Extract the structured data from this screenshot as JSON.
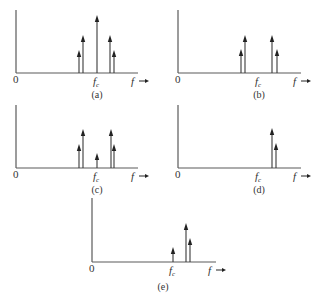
{
  "figure": {
    "axis_labels": {
      "origin": "0",
      "frequency": "f",
      "carrier": "f",
      "carrier_sub": "c"
    },
    "panels": [
      {
        "id": "a",
        "caption": "(a)",
        "origin": {
          "x": 16,
          "y": 73
        },
        "yaxis_top": 10,
        "xaxis_end": 138,
        "fc_x": 97,
        "f_label_x": 131,
        "arrow_x": [
          139,
          149
        ],
        "caption_x": 97,
        "caption_y": 98,
        "lines": [
          {
            "name": "lower-sideband-2",
            "x": 79,
            "top": 50
          },
          {
            "name": "lower-sideband-1",
            "x": 83,
            "top": 35
          },
          {
            "name": "carrier",
            "x": 97,
            "top": 15
          },
          {
            "name": "upper-sideband-1",
            "x": 110,
            "top": 35
          },
          {
            "name": "upper-sideband-2",
            "x": 114,
            "top": 50
          }
        ]
      },
      {
        "id": "b",
        "caption": "(b)",
        "origin": {
          "x": 178,
          "y": 73
        },
        "yaxis_top": 10,
        "xaxis_end": 301,
        "fc_x": 259,
        "f_label_x": 293,
        "arrow_x": [
          301,
          311
        ],
        "caption_x": 259,
        "caption_y": 98,
        "lines": [
          {
            "name": "lower-sideband-2",
            "x": 241,
            "top": 49
          },
          {
            "name": "lower-sideband-1",
            "x": 245,
            "top": 35
          },
          {
            "name": "upper-sideband-1",
            "x": 272,
            "top": 35
          },
          {
            "name": "upper-sideband-2",
            "x": 277,
            "top": 49
          }
        ]
      },
      {
        "id": "c",
        "caption": "(c)",
        "origin": {
          "x": 16,
          "y": 168
        },
        "yaxis_top": 105,
        "xaxis_end": 138,
        "fc_x": 97,
        "f_label_x": 131,
        "arrow_x": [
          139,
          149
        ],
        "caption_x": 97,
        "caption_y": 193,
        "lines": [
          {
            "name": "lower-sideband-2",
            "x": 79,
            "top": 144
          },
          {
            "name": "lower-sideband-1",
            "x": 83,
            "top": 129
          },
          {
            "name": "carrier",
            "x": 97,
            "top": 153
          },
          {
            "name": "upper-sideband-1",
            "x": 111,
            "top": 129
          },
          {
            "name": "upper-sideband-2",
            "x": 114,
            "top": 144
          }
        ]
      },
      {
        "id": "d",
        "caption": "(d)",
        "origin": {
          "x": 178,
          "y": 168
        },
        "yaxis_top": 105,
        "xaxis_end": 301,
        "fc_x": 259,
        "f_label_x": 293,
        "arrow_x": [
          301,
          311
        ],
        "caption_x": 259,
        "caption_y": 193,
        "lines": [
          {
            "name": "upper-sideband-1",
            "x": 272,
            "top": 128
          },
          {
            "name": "upper-sideband-2",
            "x": 276,
            "top": 143
          }
        ]
      },
      {
        "id": "e",
        "caption": "(e)",
        "origin": {
          "x": 92,
          "y": 262
        },
        "yaxis_top": 198,
        "xaxis_end": 216,
        "fc_x": 173,
        "f_label_x": 208,
        "arrow_x": [
          216,
          226
        ],
        "caption_x": 163,
        "caption_y": 290,
        "lines": [
          {
            "name": "carrier",
            "x": 173,
            "top": 247
          },
          {
            "name": "upper-sideband-1",
            "x": 186,
            "top": 223
          },
          {
            "name": "upper-sideband-2",
            "x": 190,
            "top": 238
          }
        ]
      }
    ]
  }
}
